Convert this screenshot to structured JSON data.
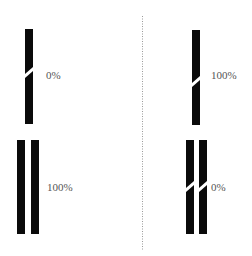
{
  "divider": {
    "style": "dotted",
    "color": "#999999"
  },
  "panels": [
    {
      "side": "left",
      "top": {
        "bars": 1,
        "broken": true,
        "label": "0%"
      },
      "bottom": {
        "bars": 2,
        "broken": false,
        "label": "100%"
      }
    },
    {
      "side": "right",
      "top": {
        "bars": 1,
        "broken": true,
        "label": "100%"
      },
      "bottom": {
        "bars": 2,
        "broken": true,
        "label": "0%"
      }
    }
  ],
  "colors": {
    "bar": "#0a0a0a",
    "text": "#555555",
    "background": "#ffffff"
  }
}
